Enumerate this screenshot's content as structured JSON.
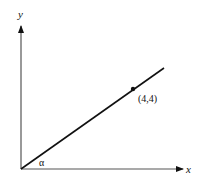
{
  "diagram": {
    "type": "coordinate-line",
    "axes": {
      "x_label": "x",
      "y_label": "y"
    },
    "line": {
      "passes_through_origin": true,
      "angle_label": "α"
    },
    "point": {
      "label": "(4,4)",
      "x": 4,
      "y": 4
    },
    "colors": {
      "stroke": "#111111",
      "background": "#ffffff"
    }
  }
}
